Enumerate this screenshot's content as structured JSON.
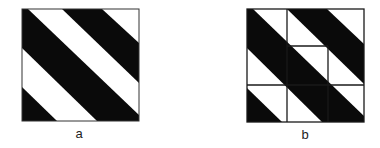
{
  "figures": [
    {
      "id": "a",
      "label": "a",
      "description": "Square with diagonal black and white stripes",
      "colors": {
        "stripe": "#0a0a0a",
        "background": "#ffffff",
        "border": "#333333"
      }
    },
    {
      "id": "b",
      "label": "b",
      "description": "Same striped square overlaid with a grid of outlined cells",
      "colors": {
        "stripe": "#0a0a0a",
        "background": "#ffffff",
        "grid": "#1a1a1a"
      }
    }
  ]
}
